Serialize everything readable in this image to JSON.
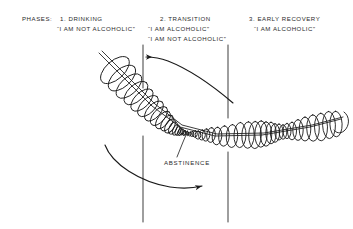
{
  "figure": {
    "background_color": "#ffffff",
    "ink_color": "#1a1a1a",
    "type": "hand-drawn conical helix diagram",
    "phases_label": "PHASES:",
    "abstinence_label": "ABSTINENCE"
  },
  "phases": [
    {
      "number": "1.",
      "title": "1. DRINKING",
      "quotes": [
        "“I AM NOT ALCOHOLIC”"
      ]
    },
    {
      "number": "2.",
      "title": "2. TRANSITION",
      "quotes": [
        "“I AM ALCOHOLIC”",
        "“I AM NOT ALCOHOLIC”"
      ]
    },
    {
      "number": "3.",
      "title": "3. EARLY RECOVERY",
      "quotes": [
        "“I AM ALCOHOLIC”"
      ]
    }
  ],
  "annotations": {
    "abstinence": "ABSTINENCE"
  }
}
